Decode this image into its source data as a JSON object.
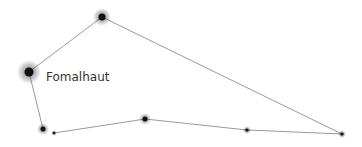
{
  "constellation": {
    "label": "Fomalhaut",
    "label_pos": [
      46,
      70
    ],
    "line_color": "#9a9a9a",
    "star_color": "#111111",
    "stars": [
      {
        "id": "s1",
        "x": 102,
        "y": 17,
        "r": 3.5,
        "glow": 9
      },
      {
        "id": "fomalhaut",
        "x": 29,
        "y": 72,
        "r": 4.5,
        "glow": 12
      },
      {
        "id": "s3",
        "x": 43,
        "y": 129,
        "r": 2.5,
        "glow": 6
      },
      {
        "id": "s4",
        "x": 54,
        "y": 133,
        "r": 1.3,
        "glow": 3
      },
      {
        "id": "s5",
        "x": 145,
        "y": 119,
        "r": 2.5,
        "glow": 6
      },
      {
        "id": "s6",
        "x": 247,
        "y": 130,
        "r": 1.6,
        "glow": 4
      },
      {
        "id": "s7",
        "x": 342,
        "y": 134,
        "r": 1.6,
        "glow": 4
      }
    ],
    "lines": [
      [
        102,
        17,
        29,
        72
      ],
      [
        29,
        72,
        43,
        129
      ],
      [
        54,
        133,
        145,
        119
      ],
      [
        145,
        119,
        247,
        130
      ],
      [
        247,
        130,
        342,
        134
      ],
      [
        102,
        17,
        342,
        134
      ]
    ]
  }
}
